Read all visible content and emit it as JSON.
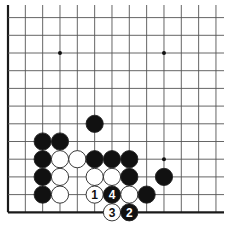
{
  "board": {
    "title": "Go problem diagram",
    "colors": {
      "background": "#ffffff",
      "line": "#555555",
      "edge": "#1a1a1a",
      "black_stone": "#111111",
      "white_stone": "#ffffff",
      "stone_outline": "#222222"
    },
    "grid": {
      "x0": 8,
      "dx": 17.33,
      "cols": 13,
      "y0": 17.6,
      "dy": 17.7,
      "rows": 12,
      "top_extent": 5,
      "right_extent": 224,
      "left_edge": true,
      "bottom_edge": true
    },
    "star_points": [
      {
        "col": 3,
        "row": 2
      },
      {
        "col": 9,
        "row": 2
      },
      {
        "col": 9,
        "row": 8
      }
    ],
    "stones": [
      {
        "col": 5,
        "row": 6,
        "color": "black",
        "label": ""
      },
      {
        "col": 2,
        "row": 7,
        "color": "black",
        "label": ""
      },
      {
        "col": 3,
        "row": 7,
        "color": "black",
        "label": ""
      },
      {
        "col": 2,
        "row": 8,
        "color": "black",
        "label": ""
      },
      {
        "col": 3,
        "row": 8,
        "color": "white",
        "label": ""
      },
      {
        "col": 4,
        "row": 8,
        "color": "white",
        "label": ""
      },
      {
        "col": 5,
        "row": 8,
        "color": "black",
        "label": ""
      },
      {
        "col": 6,
        "row": 8,
        "color": "black",
        "label": ""
      },
      {
        "col": 7,
        "row": 8,
        "color": "black",
        "label": ""
      },
      {
        "col": 2,
        "row": 9,
        "color": "black",
        "label": ""
      },
      {
        "col": 3,
        "row": 9,
        "color": "white",
        "label": ""
      },
      {
        "col": 5,
        "row": 9,
        "color": "white",
        "label": ""
      },
      {
        "col": 6,
        "row": 9,
        "color": "white",
        "label": ""
      },
      {
        "col": 7,
        "row": 9,
        "color": "black",
        "label": ""
      },
      {
        "col": 9,
        "row": 9,
        "color": "black",
        "label": ""
      },
      {
        "col": 2,
        "row": 10,
        "color": "black",
        "label": ""
      },
      {
        "col": 3,
        "row": 10,
        "color": "white",
        "label": ""
      },
      {
        "col": 5,
        "row": 10,
        "color": "white",
        "label": "1"
      },
      {
        "col": 6,
        "row": 10,
        "color": "black",
        "label": "4"
      },
      {
        "col": 7,
        "row": 10,
        "color": "white",
        "label": ""
      },
      {
        "col": 8,
        "row": 10,
        "color": "black",
        "label": ""
      },
      {
        "col": 6,
        "row": 11,
        "color": "white",
        "label": "3"
      },
      {
        "col": 7,
        "row": 11,
        "color": "black",
        "label": "2"
      }
    ]
  }
}
